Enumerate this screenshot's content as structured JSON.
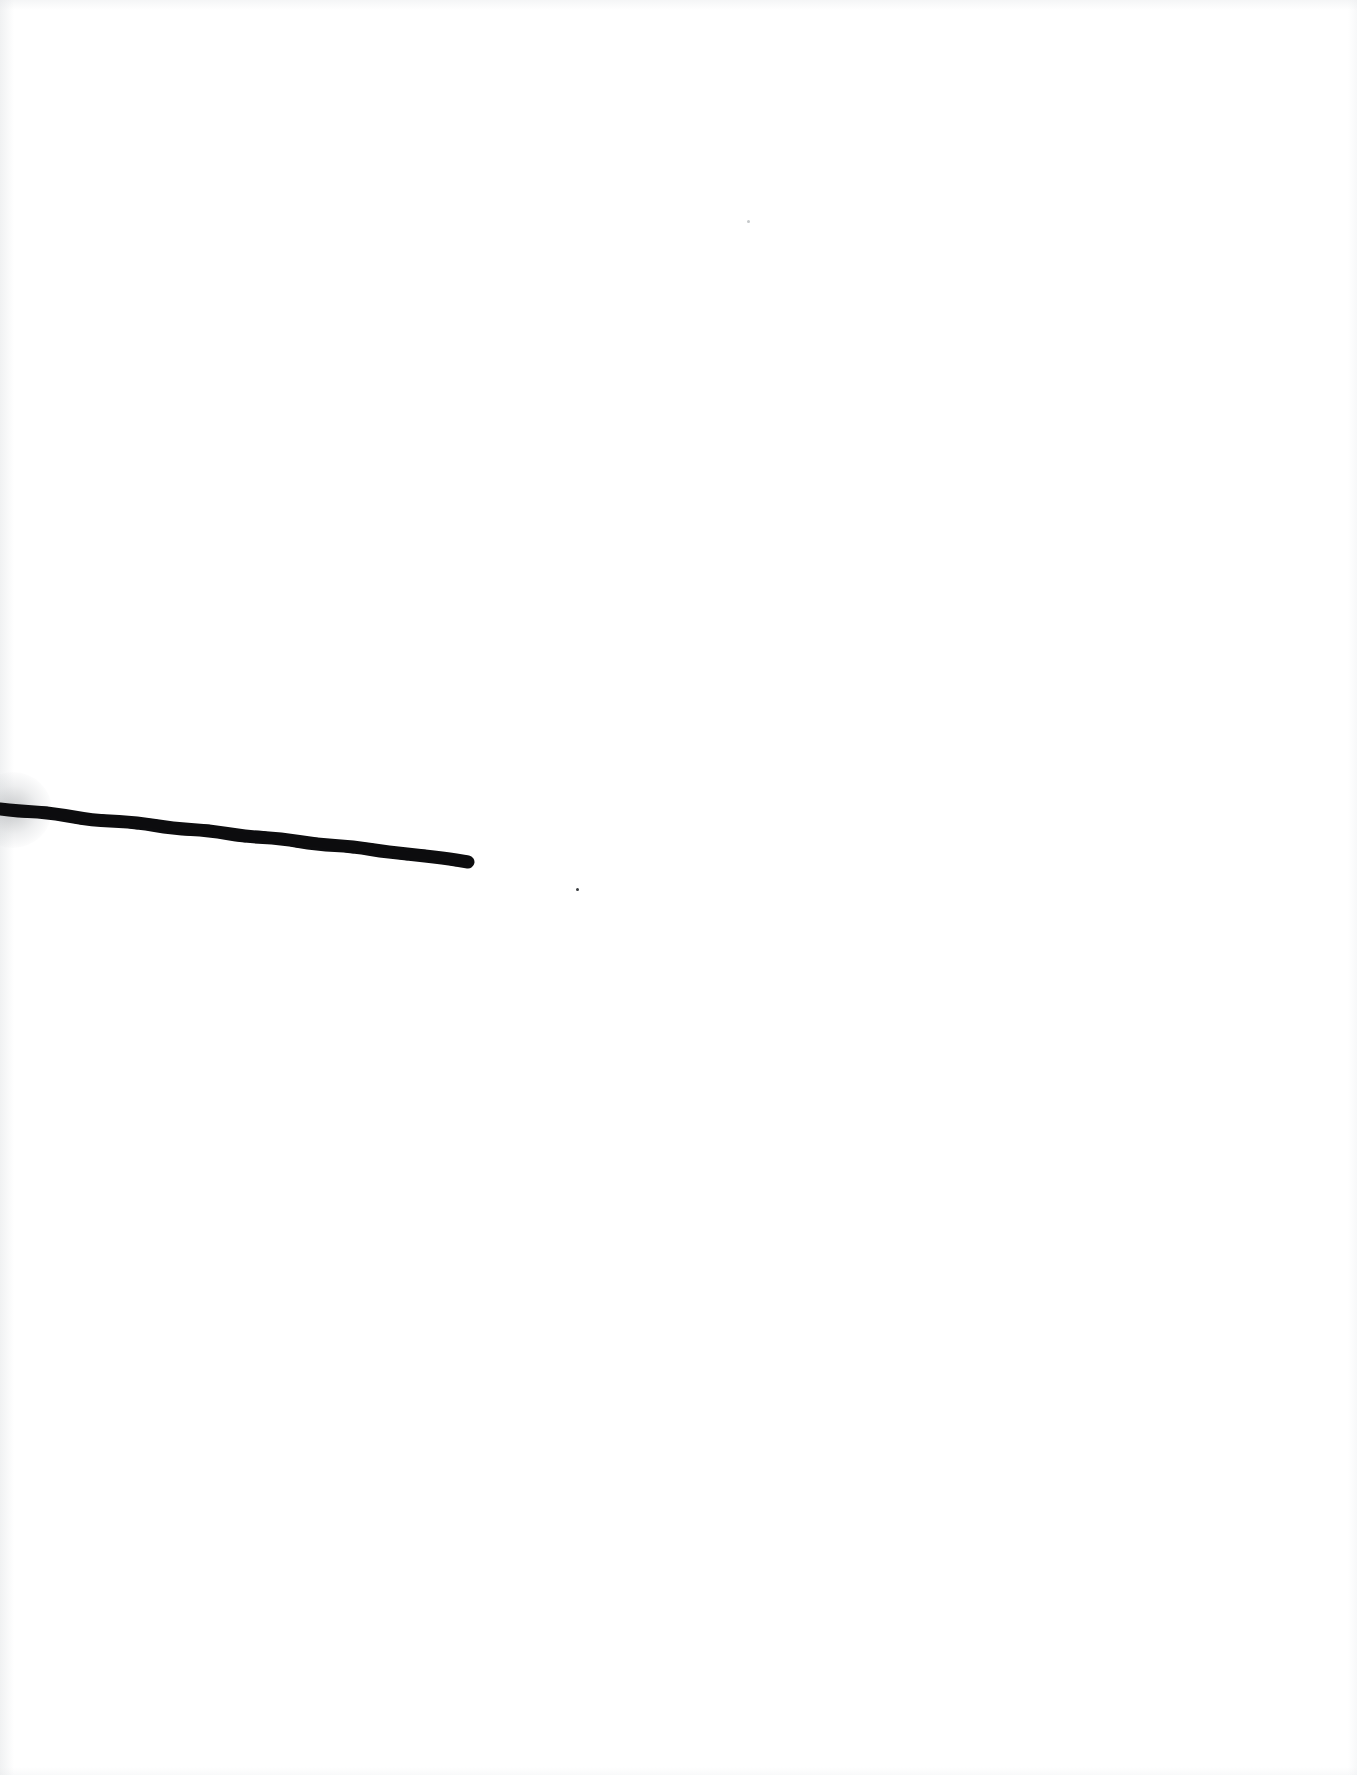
{
  "page": {
    "kind": "scanned-page",
    "width": 1357,
    "height": 1775,
    "background_color": "#ffffff",
    "text_content": "",
    "caption": ""
  },
  "artwork": {
    "title": "ink-stroke",
    "stroke_color": "#0d0d0f",
    "stroke_label": "single tapering wobbly ink line",
    "start_point": {
      "x": 0,
      "y": 810
    },
    "end_point": {
      "x": 468,
      "y": 862
    },
    "thickness_px": 13,
    "end_cap": "rounded",
    "start_cap": "cut-off at page edge",
    "path_points": [
      {
        "x": 0,
        "y": 809
      },
      {
        "x": 18,
        "y": 811
      },
      {
        "x": 38,
        "y": 812
      },
      {
        "x": 56,
        "y": 814
      },
      {
        "x": 74,
        "y": 817
      },
      {
        "x": 92,
        "y": 820
      },
      {
        "x": 110,
        "y": 821
      },
      {
        "x": 128,
        "y": 822
      },
      {
        "x": 146,
        "y": 824
      },
      {
        "x": 164,
        "y": 827
      },
      {
        "x": 182,
        "y": 829
      },
      {
        "x": 200,
        "y": 830
      },
      {
        "x": 218,
        "y": 832
      },
      {
        "x": 236,
        "y": 835
      },
      {
        "x": 254,
        "y": 837
      },
      {
        "x": 272,
        "y": 838
      },
      {
        "x": 290,
        "y": 840
      },
      {
        "x": 308,
        "y": 843
      },
      {
        "x": 326,
        "y": 845
      },
      {
        "x": 344,
        "y": 846
      },
      {
        "x": 362,
        "y": 848
      },
      {
        "x": 380,
        "y": 851
      },
      {
        "x": 398,
        "y": 853
      },
      {
        "x": 416,
        "y": 855
      },
      {
        "x": 434,
        "y": 857
      },
      {
        "x": 450,
        "y": 859
      },
      {
        "x": 462,
        "y": 861
      },
      {
        "x": 468,
        "y": 862
      }
    ]
  },
  "specks": [
    {
      "name": "speck-near-stroke-tip",
      "x": 577,
      "y": 889,
      "size": 3,
      "faint": false
    },
    {
      "name": "speck-upper-right",
      "x": 748,
      "y": 221,
      "size": 3,
      "faint": true
    }
  ]
}
